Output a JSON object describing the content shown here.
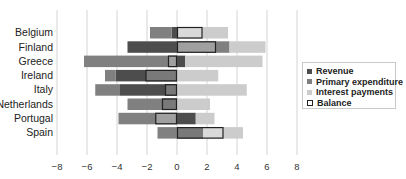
{
  "chart_data": {
    "type": "bar",
    "orientation": "horizontal",
    "stacked": true,
    "title": "",
    "xlabel": "",
    "ylabel": "",
    "xlim": [
      -8,
      8
    ],
    "x_ticks": [
      -8,
      -6,
      -4,
      -2,
      0,
      2,
      4,
      6,
      8
    ],
    "x_tick_labels": [
      "−8",
      "−6",
      "−4",
      "−2",
      "0",
      "2",
      "4",
      "6",
      "8"
    ],
    "grid": "vertical",
    "legend_position": "right",
    "categories": [
      "Belgium",
      "Finland",
      "Greece",
      "Ireland",
      "Italy",
      "Netherlands",
      "Portugal",
      "Spain"
    ],
    "series": [
      {
        "name": "Revenue",
        "color": "#4d4d4d",
        "style": "filled",
        "values": [
          -0.35,
          -3.3,
          0.55,
          -4.1,
          -3.8,
          -1.0,
          1.25,
          1.75
        ]
      },
      {
        "name": "Primary expenditure",
        "color": "#808080",
        "style": "filled",
        "values": [
          -1.45,
          3.5,
          -6.2,
          -0.7,
          -1.65,
          -2.3,
          -3.9,
          -1.3
        ]
      },
      {
        "name": "Interest payments",
        "color": "#cccccc",
        "style": "filled",
        "values": [
          3.4,
          2.4,
          5.15,
          2.75,
          4.65,
          2.2,
          1.25,
          2.65
        ]
      },
      {
        "name": "Balance",
        "color": "#222222",
        "style": "outline",
        "values": [
          1.7,
          2.6,
          -0.6,
          -2.1,
          -0.8,
          -1.0,
          -1.45,
          3.1
        ]
      }
    ]
  },
  "legend": {
    "items": [
      {
        "label": "Revenue",
        "color": "#4d4d4d",
        "style": "filled"
      },
      {
        "label": "Primary expenditure",
        "color": "#808080",
        "style": "filled"
      },
      {
        "label": "Interest payments",
        "color": "#cccccc",
        "style": "filled"
      },
      {
        "label": "Balance",
        "color": "#222222",
        "style": "outline"
      }
    ]
  }
}
